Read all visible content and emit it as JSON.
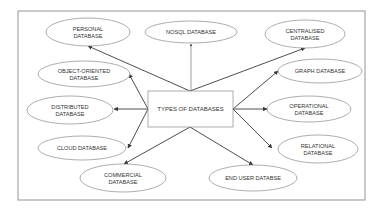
{
  "diagram": {
    "center": {
      "label": "TYPES OF DATABASES",
      "x": 148,
      "y": 91,
      "w": 85,
      "h": 36
    },
    "frame": {
      "x": 18,
      "y": 11,
      "w": 347,
      "h": 189
    },
    "colors": {
      "stroke": "#8a8a8a",
      "arrow": "#3a3a3a",
      "text": "#333333",
      "frame": "#888888"
    },
    "nodes": [
      {
        "id": "personal",
        "lines": [
          "PERSONAL",
          "DATABASE"
        ],
        "cx": 88,
        "cy": 32,
        "rx": 42,
        "ry": 14,
        "from": [
          190,
          91
        ],
        "to": [
          88,
          46
        ]
      },
      {
        "id": "nosql",
        "lines": [
          "NOSQL DATABASE"
        ],
        "cx": 191,
        "cy": 32,
        "rx": 46,
        "ry": 11,
        "from": [
          191,
          90
        ],
        "to": [
          191,
          44
        ]
      },
      {
        "id": "centralised",
        "lines": [
          "CENTRALISED",
          "DATABASE"
        ],
        "cx": 305,
        "cy": 34,
        "rx": 40,
        "ry": 14,
        "from": [
          190,
          91
        ],
        "to": [
          305,
          48
        ]
      },
      {
        "id": "object-oriented",
        "lines": [
          "OBJECT-ORIENTED",
          "DATABASE"
        ],
        "cx": 84,
        "cy": 74,
        "rx": 46,
        "ry": 13,
        "from": [
          148,
          109
        ],
        "to": [
          129,
          74
        ]
      },
      {
        "id": "graph",
        "lines": [
          "GRAPH DATABASE"
        ],
        "cx": 320,
        "cy": 71,
        "rx": 42,
        "ry": 12,
        "from": [
          233,
          109
        ],
        "to": [
          278,
          71
        ]
      },
      {
        "id": "distributed",
        "lines": [
          "DISTRIBUTED",
          "DATABASE"
        ],
        "cx": 70,
        "cy": 110,
        "rx": 43,
        "ry": 14,
        "from": [
          148,
          109
        ],
        "to": [
          114,
          109
        ]
      },
      {
        "id": "operational",
        "lines": [
          "OPERATIONAL",
          "DATABASE"
        ],
        "cx": 309,
        "cy": 109,
        "rx": 42,
        "ry": 13,
        "from": [
          233,
          109
        ],
        "to": [
          267,
          109
        ]
      },
      {
        "id": "cloud",
        "lines": [
          "CLOUD DATABASE"
        ],
        "cx": 82,
        "cy": 148,
        "rx": 44,
        "ry": 12,
        "from": [
          148,
          109
        ],
        "to": [
          128,
          148
        ]
      },
      {
        "id": "relational",
        "lines": [
          "RELATIONAL",
          "DATABASE"
        ],
        "cx": 318,
        "cy": 149,
        "rx": 40,
        "ry": 14,
        "from": [
          233,
          109
        ],
        "to": [
          272,
          148
        ]
      },
      {
        "id": "commercial",
        "lines": [
          "COMMERCIAL",
          "DATABASE"
        ],
        "cx": 123,
        "cy": 178,
        "rx": 43,
        "ry": 14,
        "from": [
          190,
          127
        ],
        "to": [
          124,
          164
        ]
      },
      {
        "id": "end-user",
        "lines": [
          "END USER DATABSE"
        ],
        "cx": 253,
        "cy": 178,
        "rx": 44,
        "ry": 13,
        "from": [
          190,
          127
        ],
        "to": [
          253,
          165
        ]
      }
    ]
  }
}
